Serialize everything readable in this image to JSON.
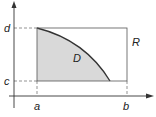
{
  "diagram": {
    "type": "region-in-rectangle",
    "labels": {
      "y_upper": "d",
      "y_lower": "c",
      "x_left": "a",
      "x_right": "b",
      "region": "D",
      "rectangle": "R"
    },
    "colors": {
      "region_fill": "#d9d9d9",
      "stroke": "#333333",
      "dashed": "#666666"
    }
  }
}
